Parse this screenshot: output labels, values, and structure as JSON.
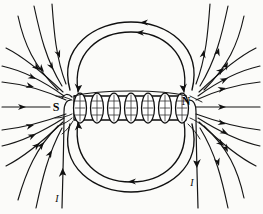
{
  "figure": {
    "kind": "magnetic-field-diagram",
    "background_color": "#fbfbf9",
    "ink_color": "#101010",
    "width": 263,
    "height": 214
  },
  "labels": {
    "south_pole": "S",
    "north_pole": "N",
    "current_left": "I",
    "current_right": "I"
  },
  "solenoid": {
    "turn_count": 7,
    "axis_y": 107,
    "left_end_x": 72,
    "right_end_x": 186,
    "description": "helical coil drawn as stacked elliptical turns with cross hatching"
  },
  "field_lines": {
    "direction_note": "lines emerge at N (right) and re-enter at S (left)",
    "top_loop_arrow": "left",
    "bottom_loop_arrow": "left",
    "axis_arrow_left": "right",
    "axis_arrow_right": "right",
    "loop_count_outer": 2,
    "fan_line_count": 24
  },
  "leads": {
    "left_lead_arrow": "up",
    "right_lead_arrow": "down"
  }
}
